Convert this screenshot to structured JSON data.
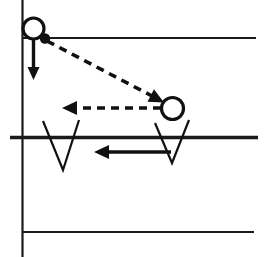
{
  "figure": {
    "width": 264,
    "height": 257,
    "background_color": "#ffffff",
    "ink_color": "#111111"
  },
  "axes": {
    "vertical_axis": {
      "name": "vertical-axis",
      "x": 22.5,
      "y1": 0,
      "y2": 257,
      "stroke_width": 2.2,
      "color": "#1a1a1a"
    },
    "horizontal_lines": [
      {
        "name": "upper-ledge-line",
        "label": "top ledge",
        "x1": 22.5,
        "x2": 256,
        "y": 38,
        "stroke_width": 2.0,
        "color": "#2a2a2a"
      },
      {
        "name": "ground-line",
        "label": "ground",
        "x1": 10,
        "x2": 258,
        "y": 137.5,
        "stroke_width": 3.6,
        "color": "#111111"
      },
      {
        "name": "lower-reference-line",
        "label": "lower reference",
        "x1": 22.5,
        "x2": 254,
        "y": 232,
        "stroke_width": 2.0,
        "color": "#2a2a2a"
      }
    ]
  },
  "circles": [
    {
      "name": "ball-start",
      "label": "ball at launch",
      "cx": 33.5,
      "cy": 28.5,
      "r": 10.5,
      "style": "open"
    },
    {
      "name": "ball-landing",
      "label": "ball at impact",
      "cx": 172.5,
      "cy": 108.5,
      "r": 11.0,
      "style": "open"
    }
  ],
  "point_markers": [
    {
      "name": "origin-dot",
      "label": "release point",
      "cx": 45.0,
      "cy": 38.5,
      "r": 5.2,
      "style": "filled"
    }
  ],
  "vectors": [
    {
      "name": "gravity-vector",
      "label": "downward solid vector",
      "style": "solid",
      "x1": 33.5,
      "y1": 39.0,
      "x2": 33.5,
      "y2": 72.0,
      "head_at": "end",
      "head_angle_deg": 90,
      "head_tip_x": 33.5,
      "head_tip_y": 80.0,
      "head_length": 13,
      "head_half_width": 6
    },
    {
      "name": "incoming-trajectory-vector",
      "label": "diagonal dashed vector toward impact",
      "style": "dashed",
      "x1": 47.0,
      "y1": 41.0,
      "x2": 152.0,
      "y2": 96.0,
      "head_at": "end",
      "head_tip_x": 164.0,
      "head_tip_y": 102.5,
      "head_length": 15,
      "head_half_width": 7
    },
    {
      "name": "rebound-velocity-vector",
      "label": "horizontal dashed vector pointing left",
      "style": "dashed",
      "x1": 161.0,
      "y1": 108.0,
      "x2": 76.0,
      "y2": 108.0,
      "head_at": "end",
      "head_tip_x": 62.0,
      "head_tip_y": 108.0,
      "head_length": 15,
      "head_half_width": 7
    },
    {
      "name": "ground-reaction-vector",
      "label": "horizontal solid vector pointing left",
      "style": "solid",
      "x1": 171.0,
      "y1": 152.0,
      "x2": 109.0,
      "y2": 152.0,
      "head_at": "end",
      "head_tip_x": 94.0,
      "head_tip_y": 152.0,
      "head_length": 15,
      "head_half_width": 7
    }
  ],
  "vee_marks": [
    {
      "name": "vee-mark-left",
      "label": "left V notch crossing ground",
      "points": "43,121 63,170 79,120"
    },
    {
      "name": "vee-mark-right",
      "label": "right V notch crossing ground",
      "points": "155,123 172,163 189,120"
    }
  ]
}
